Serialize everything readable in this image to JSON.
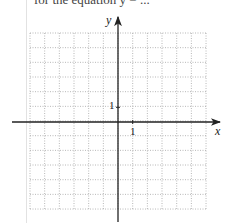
{
  "header": {
    "clipped_text": "for  the  equation  y  =  ..."
  },
  "graph": {
    "x_label": "x",
    "y_label": "y",
    "x_tick_label": "1",
    "y_tick_label": "1",
    "x_range": [
      -6,
      6
    ],
    "y_range": [
      -6,
      6
    ],
    "grid": "dotted",
    "grid_color": "#9a9a9a",
    "axis_color": "#222222"
  }
}
